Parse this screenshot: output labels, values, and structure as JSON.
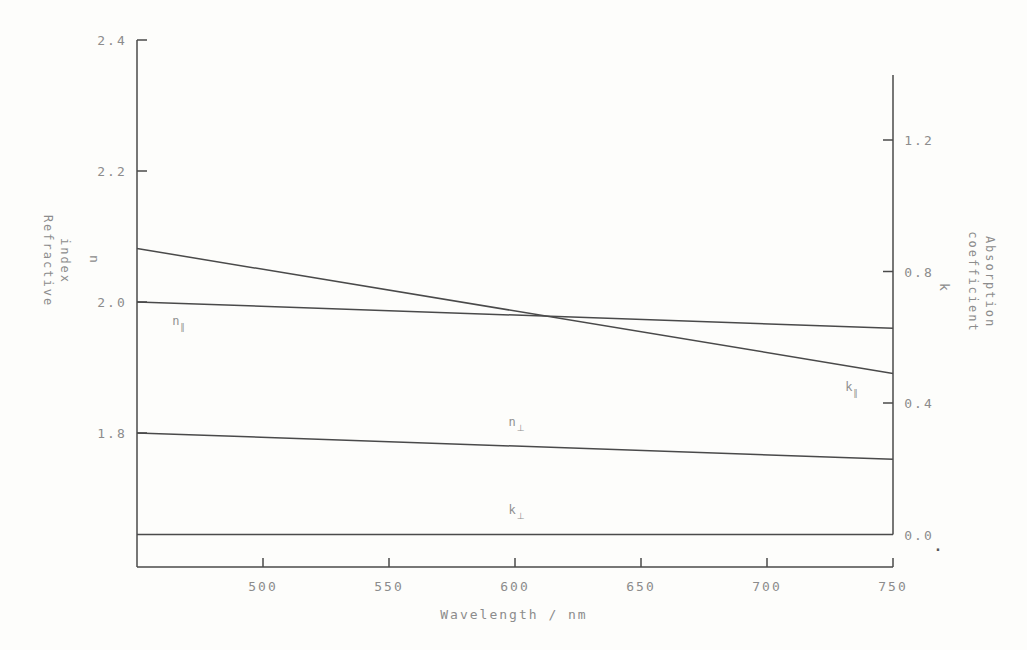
{
  "colors": {
    "background": "#fdfdfb",
    "line": "#4a4a4a",
    "text": "#8c8c8c",
    "curve_label": "#909090"
  },
  "artifacts": {
    "dot": "."
  },
  "chart_data": {
    "type": "line",
    "title": "",
    "xlabel": "Wavelength / nm",
    "x_range": [
      450,
      750
    ],
    "grid": false,
    "legend": "inline-labels",
    "x_ticks": [
      {
        "value": 500,
        "label": "500"
      },
      {
        "value": 550,
        "label": "550"
      },
      {
        "value": 600,
        "label": "600"
      },
      {
        "value": 650,
        "label": "650"
      },
      {
        "value": 700,
        "label": "700"
      },
      {
        "value": 750,
        "label": "750"
      }
    ],
    "left_axis": {
      "title_lines": [
        "Refractive",
        "index"
      ],
      "symbol": "n",
      "range": [
        1.6,
        2.4
      ],
      "ticks": [
        {
          "value": 2.4,
          "label": "2.4"
        },
        {
          "value": 2.2,
          "label": "2.2"
        },
        {
          "value": 2.0,
          "label": "2.0"
        },
        {
          "value": 1.8,
          "label": "1.8"
        }
      ]
    },
    "right_axis": {
      "title_lines": [
        "Absorption",
        "coefficient"
      ],
      "symbol": "k",
      "range": [
        0.0,
        1.4
      ],
      "ticks": [
        {
          "value": 1.2,
          "label": "1.2"
        },
        {
          "value": 0.8,
          "label": "0.8"
        },
        {
          "value": 0.4,
          "label": "0.4"
        },
        {
          "value": 0.0,
          "label": "0.0",
          "mark": false
        }
      ]
    },
    "series": [
      {
        "name": "k-parallel",
        "label_main": "k",
        "label_sub": "∥",
        "axis": "right",
        "points": [
          {
            "x": 450,
            "y": 0.87
          },
          {
            "x": 750,
            "y": 0.49
          }
        ]
      },
      {
        "name": "n-parallel",
        "label_main": "n",
        "label_sub": "∥",
        "axis": "left",
        "points": [
          {
            "x": 450,
            "y": 2.0
          },
          {
            "x": 750,
            "y": 1.96
          }
        ]
      },
      {
        "name": "n-perpendicular",
        "label_main": "n",
        "label_sub": "⊥",
        "axis": "left",
        "points": [
          {
            "x": 450,
            "y": 1.8
          },
          {
            "x": 750,
            "y": 1.76
          }
        ]
      },
      {
        "name": "k-perpendicular",
        "label_main": "k",
        "label_sub": "⊥",
        "axis": "right",
        "points": [
          {
            "x": 450,
            "y": 0.0
          },
          {
            "x": 750,
            "y": 0.0
          }
        ]
      }
    ]
  }
}
